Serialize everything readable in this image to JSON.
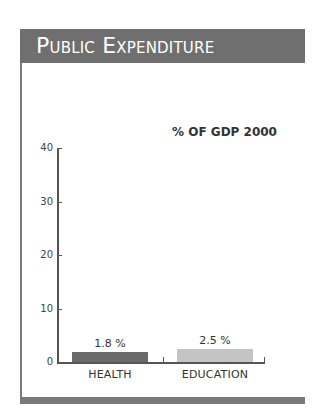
{
  "header": {
    "title": "Public Expenditure"
  },
  "chart_data": {
    "type": "bar",
    "title": "% OF GDP 2000",
    "categories": [
      "HEALTH",
      "EDUCATION"
    ],
    "values": [
      1.8,
      2.5
    ],
    "value_labels": [
      "1.8 %",
      "2.5 %"
    ],
    "bar_colors": [
      "#6a6a6a",
      "#c4c4c4"
    ],
    "xlabel": "",
    "ylabel": "",
    "ylim": [
      0,
      40
    ],
    "yticks": [
      0,
      10,
      20,
      30,
      40
    ],
    "ytick_labels": [
      "0",
      "10",
      "20",
      "30",
      "40"
    ],
    "grid": false,
    "legend": "none"
  },
  "colors": {
    "header_bg": "#6f6f6f",
    "header_text": "#ffffff",
    "frame": "#7a7a7a",
    "axis": "#555555"
  }
}
